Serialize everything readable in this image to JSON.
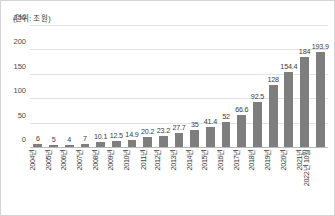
{
  "chart_data": {
    "type": "bar",
    "title": "",
    "unit_note": "(단위: 조 원)",
    "xlabel": "",
    "ylabel": "",
    "ylim": [
      0,
      250
    ],
    "yticks": [
      0,
      50,
      100,
      150,
      200,
      250
    ],
    "grid": true,
    "legend": null,
    "bar_color": "#7e7e7e",
    "categories": [
      "2004년",
      "2005년",
      "2006년",
      "2007년",
      "2008년",
      "2009년",
      "2010년",
      "2011년",
      "2012년",
      "2013년",
      "2014년",
      "2015년",
      "2016년",
      "2017년",
      "2018년",
      "2019년",
      "2020년",
      "2021년",
      "2022년 10월"
    ],
    "values": [
      6,
      5,
      4,
      7,
      10.1,
      12.5,
      14.9,
      20.2,
      23.2,
      27.7,
      35,
      41.4,
      52,
      66.6,
      92.5,
      128,
      154.4,
      184,
      193.9
    ],
    "value_labels": [
      "6",
      "5",
      "4",
      "7",
      "10.1",
      "12.5",
      "14.9",
      "20.2",
      "23.2",
      "27.7",
      "35",
      "41.4",
      "52",
      "66.6",
      "92.5",
      "128",
      "154.4",
      "184",
      "193.9"
    ]
  }
}
